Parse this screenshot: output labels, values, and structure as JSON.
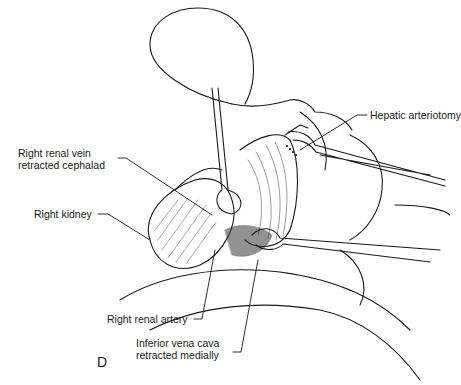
{
  "figure": {
    "panel_letter": "D",
    "labels": {
      "hepatic_arteriotomy": "Hepatic arteriotomy",
      "right_renal_vein_line1": "Right renal vein",
      "right_renal_vein_line2": "retracted cephalad",
      "right_kidney": "Right kidney",
      "right_renal_artery": "Right renal artery",
      "ivc_line1": "Inferior vena cava",
      "ivc_line2": "retracted medially"
    },
    "colors": {
      "ink": "#1a1a1a",
      "background": "#ffffff"
    }
  }
}
